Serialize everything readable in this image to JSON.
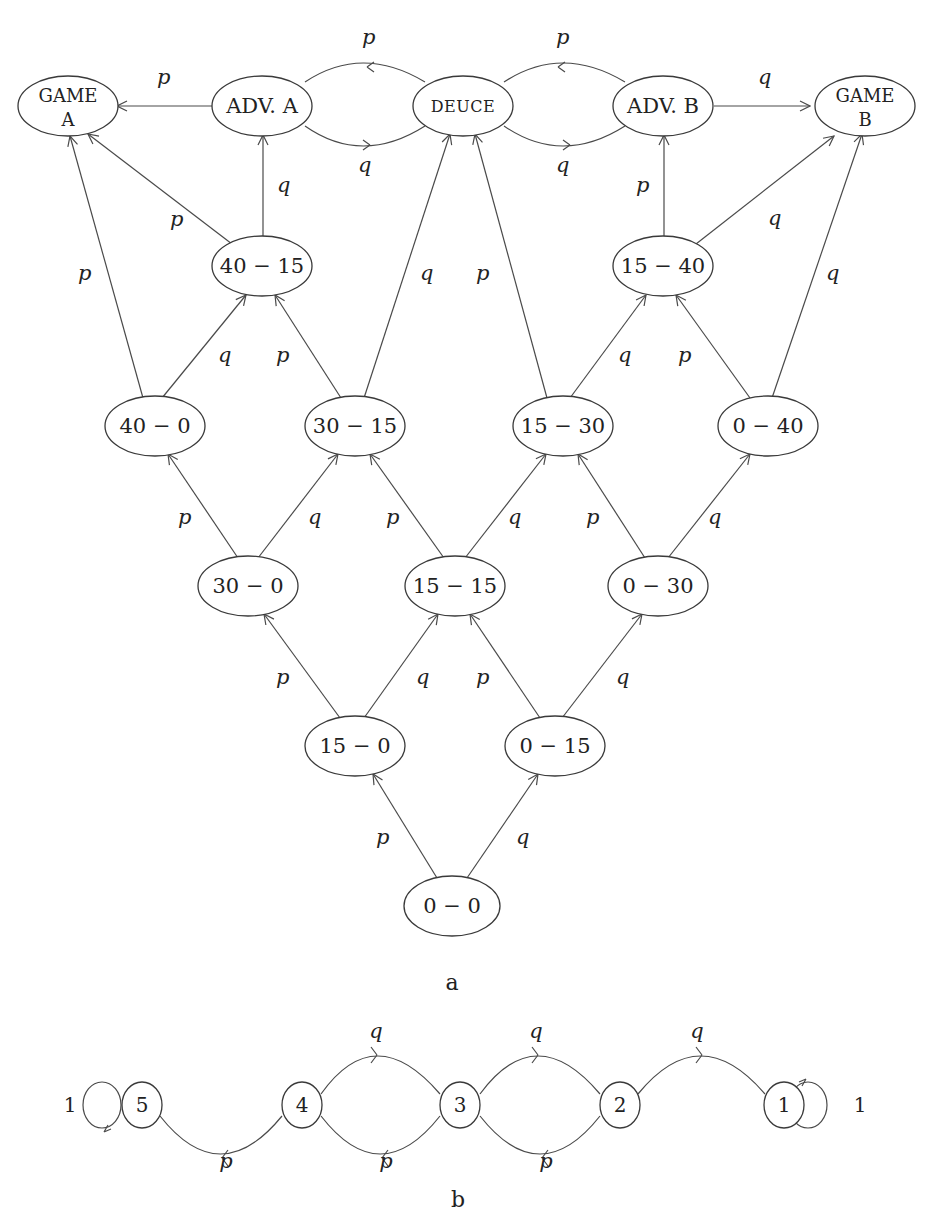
{
  "figure_a": {
    "caption": "a",
    "nodes": [
      {
        "id": "game_a",
        "lines": [
          "GAME",
          "A"
        ],
        "x": 68,
        "y": 106
      },
      {
        "id": "adv_a",
        "lines": [
          "ADV. A"
        ],
        "x": 262,
        "y": 106
      },
      {
        "id": "deuce",
        "lines": [
          "DEUCE"
        ],
        "x": 463,
        "y": 106,
        "small_caps": true
      },
      {
        "id": "adv_b",
        "lines": [
          "ADV. B"
        ],
        "x": 663,
        "y": 106
      },
      {
        "id": "game_b",
        "lines": [
          "GAME",
          "B"
        ],
        "x": 858,
        "y": 106
      },
      {
        "id": "s40_15",
        "lines": [
          "40 − 15"
        ],
        "x": 262,
        "y": 266
      },
      {
        "id": "s15_40",
        "lines": [
          "15 − 40"
        ],
        "x": 663,
        "y": 266
      },
      {
        "id": "s40_0",
        "lines": [
          "40 − 0"
        ],
        "x": 155,
        "y": 426
      },
      {
        "id": "s30_15",
        "lines": [
          "30 − 15"
        ],
        "x": 355,
        "y": 426
      },
      {
        "id": "s15_30",
        "lines": [
          "15 − 30"
        ],
        "x": 563,
        "y": 426
      },
      {
        "id": "s0_40",
        "lines": [
          "0 − 40"
        ],
        "x": 768,
        "y": 426
      },
      {
        "id": "s30_0",
        "lines": [
          "30 − 0"
        ],
        "x": 248,
        "y": 586
      },
      {
        "id": "s15_15",
        "lines": [
          "15 − 15"
        ],
        "x": 455,
        "y": 586
      },
      {
        "id": "s0_30",
        "lines": [
          "0 − 30"
        ],
        "x": 658,
        "y": 586
      },
      {
        "id": "s15_0",
        "lines": [
          "15 − 0"
        ],
        "x": 355,
        "y": 746
      },
      {
        "id": "s0_15",
        "lines": [
          "0 − 15"
        ],
        "x": 555,
        "y": 746
      },
      {
        "id": "s0_0",
        "lines": [
          "0 − 0"
        ],
        "x": 452,
        "y": 906
      }
    ],
    "edges": [
      {
        "from": "s0_0",
        "to": "s15_0",
        "label": "p"
      },
      {
        "from": "s0_0",
        "to": "s0_15",
        "label": "q"
      },
      {
        "from": "s15_0",
        "to": "s30_0",
        "label": "p"
      },
      {
        "from": "s15_0",
        "to": "s15_15",
        "label": "q"
      },
      {
        "from": "s0_15",
        "to": "s15_15",
        "label": "p"
      },
      {
        "from": "s0_15",
        "to": "s0_30",
        "label": "q"
      },
      {
        "from": "s30_0",
        "to": "s40_0",
        "label": "p"
      },
      {
        "from": "s30_0",
        "to": "s30_15",
        "label": "q"
      },
      {
        "from": "s15_15",
        "to": "s30_15",
        "label": "p"
      },
      {
        "from": "s15_15",
        "to": "s15_30",
        "label": "q"
      },
      {
        "from": "s0_30",
        "to": "s15_30",
        "label": "p"
      },
      {
        "from": "s0_30",
        "to": "s0_40",
        "label": "q"
      },
      {
        "from": "s40_0",
        "to": "game_a",
        "label": "p"
      },
      {
        "from": "s40_0",
        "to": "s40_15",
        "label": "q"
      },
      {
        "from": "s30_15",
        "to": "s40_15",
        "label": "p"
      },
      {
        "from": "s30_15",
        "to": "deuce",
        "label": "q"
      },
      {
        "from": "s15_30",
        "to": "deuce",
        "label": "p"
      },
      {
        "from": "s15_30",
        "to": "s15_40",
        "label": "q"
      },
      {
        "from": "s0_40",
        "to": "s15_40",
        "label": "p"
      },
      {
        "from": "s0_40",
        "to": "game_b",
        "label": "q"
      },
      {
        "from": "s40_15",
        "to": "game_a",
        "label": "p"
      },
      {
        "from": "s40_15",
        "to": "adv_a",
        "label": "q"
      },
      {
        "from": "s15_40",
        "to": "adv_b",
        "label": "p"
      },
      {
        "from": "s15_40",
        "to": "game_b",
        "label": "q"
      },
      {
        "from": "adv_a",
        "to": "game_a",
        "label": "p"
      },
      {
        "from": "adv_a",
        "to": "deuce",
        "label": "q"
      },
      {
        "from": "deuce",
        "to": "adv_a",
        "label": "p"
      },
      {
        "from": "deuce",
        "to": "adv_b",
        "label": "q"
      },
      {
        "from": "adv_b",
        "to": "deuce",
        "label": "p"
      },
      {
        "from": "adv_b",
        "to": "game_b",
        "label": "q"
      }
    ]
  },
  "figure_b": {
    "caption": "b",
    "states": [
      "5",
      "4",
      "3",
      "2",
      "1"
    ],
    "self_loop_label_left": "1",
    "self_loop_label_right": "1",
    "edges": [
      {
        "from": "4",
        "to": "3",
        "label": "q"
      },
      {
        "from": "3",
        "to": "2",
        "label": "q"
      },
      {
        "from": "2",
        "to": "1",
        "label": "q"
      },
      {
        "from": "4",
        "to": "5",
        "label": "p"
      },
      {
        "from": "3",
        "to": "4",
        "label": "p"
      },
      {
        "from": "2",
        "to": "3",
        "label": "p"
      },
      {
        "from": "5",
        "to": "5",
        "label": "1"
      },
      {
        "from": "1",
        "to": "1",
        "label": "1"
      }
    ]
  },
  "labels": {
    "p": "p",
    "q": "q"
  }
}
